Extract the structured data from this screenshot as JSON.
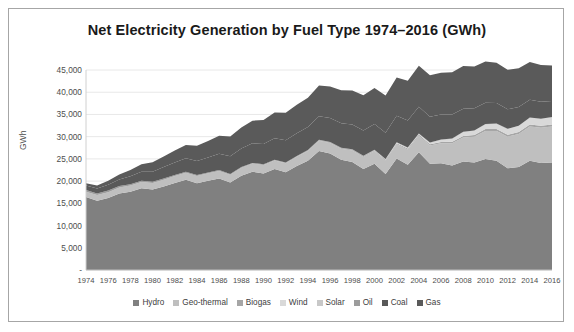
{
  "chart_data": {
    "type": "area",
    "stacked": true,
    "title": "Net Electricity Generation by Fuel Type 1974–2016 (GWh)",
    "xlabel": "",
    "ylabel": "GWh",
    "ylim": [
      0,
      45000
    ],
    "ytick_labels": [
      "-",
      "5,000",
      "10,000",
      "15,000",
      "20,000",
      "25,000",
      "30,000",
      "35,000",
      "40,000",
      "45,000"
    ],
    "ytick_values": [
      0,
      5000,
      10000,
      15000,
      20000,
      25000,
      30000,
      35000,
      40000,
      45000
    ],
    "grid": true,
    "legend_position": "bottom",
    "x": [
      1974,
      1975,
      1976,
      1977,
      1978,
      1979,
      1980,
      1981,
      1982,
      1983,
      1984,
      1985,
      1986,
      1987,
      1988,
      1989,
      1990,
      1991,
      1992,
      1993,
      1994,
      1995,
      1996,
      1997,
      1998,
      1999,
      2000,
      2001,
      2002,
      2003,
      2004,
      2005,
      2006,
      2007,
      2008,
      2009,
      2010,
      2011,
      2012,
      2013,
      2014,
      2015,
      2016
    ],
    "xtick_labels": [
      "1974",
      "1976",
      "1978",
      "1980",
      "1982",
      "1984",
      "1986",
      "1988",
      "1990",
      "1992",
      "1994",
      "1996",
      "1998",
      "2000",
      "2002",
      "2004",
      "2006",
      "2008",
      "2010",
      "2012",
      "2014",
      "2016"
    ],
    "series": [
      {
        "name": "Hydro",
        "color": "#808080",
        "values": [
          16400,
          15600,
          16200,
          17200,
          17600,
          18400,
          18100,
          18800,
          19600,
          20300,
          19500,
          20100,
          20600,
          19700,
          21200,
          22100,
          21700,
          22700,
          22000,
          23400,
          24600,
          26800,
          26200,
          24800,
          24300,
          22700,
          23900,
          21600,
          25100,
          23700,
          26500,
          23900,
          24000,
          23500,
          24400,
          24200,
          25000,
          24600,
          22900,
          23200,
          24600,
          24100,
          24200
        ]
      },
      {
        "name": "Geo-thermal",
        "color": "#bfbfbf",
        "values": [
          1200,
          1250,
          1300,
          1350,
          1400,
          1400,
          1450,
          1500,
          1550,
          1600,
          1650,
          1650,
          1700,
          1750,
          1800,
          1850,
          1900,
          1950,
          2000,
          2100,
          2200,
          2300,
          2400,
          2500,
          2600,
          2700,
          2800,
          3000,
          3200,
          3400,
          3700,
          4100,
          4500,
          5000,
          5400,
          5800,
          6300,
          6700,
          7100,
          7400,
          7700,
          7900,
          8100
        ]
      },
      {
        "name": "Biogas",
        "color": "#a6a6a6",
        "values": [
          0,
          0,
          0,
          0,
          0,
          0,
          0,
          0,
          0,
          0,
          0,
          0,
          0,
          0,
          0,
          0,
          30,
          40,
          50,
          60,
          80,
          100,
          120,
          140,
          160,
          180,
          200,
          220,
          240,
          260,
          280,
          300,
          320,
          340,
          360,
          380,
          400,
          410,
          420,
          430,
          440,
          450,
          460
        ]
      },
      {
        "name": "Wind",
        "color": "#d9d9d9",
        "values": [
          0,
          0,
          0,
          0,
          0,
          0,
          0,
          0,
          0,
          0,
          0,
          0,
          0,
          0,
          0,
          0,
          0,
          0,
          0,
          0,
          0,
          0,
          0,
          0,
          20,
          40,
          60,
          90,
          120,
          150,
          200,
          350,
          500,
          700,
          900,
          1000,
          1100,
          1200,
          1300,
          1400,
          1500,
          1550,
          1600
        ]
      },
      {
        "name": "Solar",
        "color": "#c8c8c8",
        "values": [
          0,
          0,
          0,
          0,
          0,
          0,
          0,
          0,
          0,
          0,
          0,
          0,
          0,
          0,
          0,
          0,
          0,
          0,
          0,
          0,
          0,
          0,
          0,
          0,
          0,
          0,
          0,
          0,
          0,
          0,
          0,
          0,
          0,
          0,
          0,
          0,
          5,
          10,
          15,
          20,
          25,
          30,
          35
        ]
      },
      {
        "name": "Oil",
        "color": "#9c9c9c",
        "values": [
          400,
          380,
          360,
          340,
          320,
          300,
          280,
          260,
          240,
          220,
          200,
          190,
          180,
          170,
          160,
          150,
          140,
          130,
          120,
          110,
          100,
          95,
          90,
          85,
          80,
          75,
          70,
          65,
          60,
          55,
          50,
          45,
          40,
          38,
          36,
          34,
          32,
          30,
          28,
          26,
          24,
          22,
          20
        ]
      },
      {
        "name": "Coal",
        "color": "#595959",
        "values": [
          1000,
          1100,
          1300,
          1500,
          1800,
          2000,
          2300,
          2600,
          2800,
          3000,
          3200,
          3400,
          3700,
          4000,
          4200,
          4400,
          4600,
          4800,
          5000,
          5100,
          5200,
          5300,
          5400,
          5500,
          5600,
          5700,
          5800,
          5900,
          6000,
          6100,
          6000,
          5800,
          5600,
          5400,
          5200,
          5000,
          4800,
          4600,
          4400,
          4200,
          4000,
          3800,
          3600
        ]
      },
      {
        "name": "Gas",
        "color": "#5a5a5a",
        "values": [
          500,
          700,
          900,
          1100,
          1400,
          1700,
          2100,
          2400,
          2700,
          3000,
          3400,
          3700,
          4000,
          4400,
          4700,
          5100,
          5400,
          5800,
          6200,
          6400,
          6600,
          6900,
          7100,
          7400,
          7600,
          7900,
          8100,
          8400,
          8600,
          8900,
          9200,
          9300,
          9400,
          9500,
          9600,
          9400,
          9300,
          9100,
          8900,
          8700,
          8500,
          8300,
          8000
        ]
      }
    ]
  },
  "legend": {
    "items": [
      {
        "label": "Hydro",
        "color": "#808080"
      },
      {
        "label": "Geo-thermal",
        "color": "#bfbfbf"
      },
      {
        "label": "Biogas",
        "color": "#a6a6a6"
      },
      {
        "label": "Wind",
        "color": "#d9d9d9"
      },
      {
        "label": "Solar",
        "color": "#c8c8c8"
      },
      {
        "label": "Oil",
        "color": "#9c9c9c"
      },
      {
        "label": "Coal",
        "color": "#595959"
      },
      {
        "label": "Gas",
        "color": "#5a5a5a"
      }
    ]
  },
  "style": {
    "border_color": "#a6a6a6",
    "grid_color": "#e8e8e8",
    "text_color": "#4d4d4d",
    "title_color": "#1a1a1a",
    "background": "#ffffff"
  }
}
